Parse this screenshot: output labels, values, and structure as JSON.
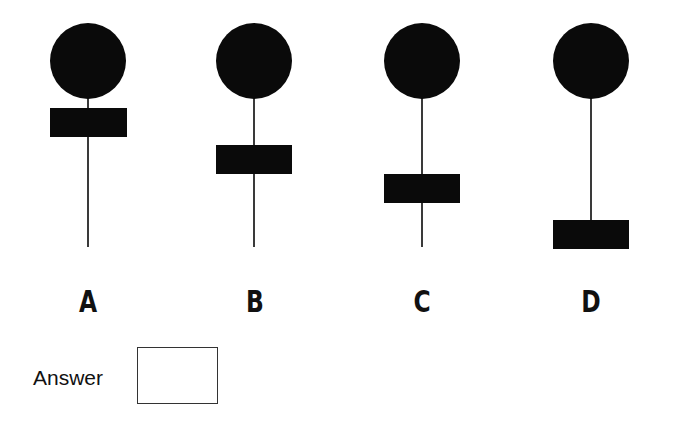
{
  "options": [
    {
      "label": "A",
      "cx": 88,
      "circle_top": 23,
      "r": 38,
      "block_top": 108,
      "block_h": 29,
      "block_w": 77,
      "stem_bottom": 247
    },
    {
      "label": "B",
      "cx": 254,
      "circle_top": 23,
      "r": 38,
      "block_top": 145,
      "block_h": 29,
      "block_w": 76,
      "stem_bottom": 247
    },
    {
      "label": "C",
      "cx": 422,
      "circle_top": 23,
      "r": 38,
      "block_top": 174,
      "block_h": 29,
      "block_w": 76,
      "stem_bottom": 247
    },
    {
      "label": "D",
      "cx": 591,
      "circle_top": 23,
      "r": 38,
      "block_top": 220,
      "block_h": 29,
      "block_w": 76,
      "stem_bottom": 220
    }
  ],
  "answer": {
    "label": "Answer",
    "value": ""
  },
  "colors": {
    "shape": "#0a0a0a",
    "stem": "#3a3a3a"
  }
}
